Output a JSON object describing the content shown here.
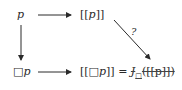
{
  "diagram": {
    "nodes": {
      "top_left": {
        "var": "p"
      },
      "top_right": {
        "open": "[[",
        "var": "p",
        "close": "]]"
      },
      "bottom_left": {
        "box": "□",
        "var": "p"
      },
      "bottom_right": {
        "lhs_open": "[[",
        "lhs_box": "□",
        "lhs_var": "p",
        "lhs_close": "]]",
        "equals": "=",
        "func": "J",
        "func_sub": "□",
        "arg": "([[p]])"
      }
    },
    "edges": [
      {
        "from": "p",
        "to": "[[p]]",
        "label": ""
      },
      {
        "from": "p",
        "to": "□p",
        "label": ""
      },
      {
        "from": "□p",
        "to": "[[□p]]",
        "label": ""
      },
      {
        "from": "[[p]]",
        "to": "J□([[p]])",
        "label": "?"
      }
    ],
    "diagonal_label": "?",
    "colors": {
      "ink": "#2a2a2a"
    }
  }
}
